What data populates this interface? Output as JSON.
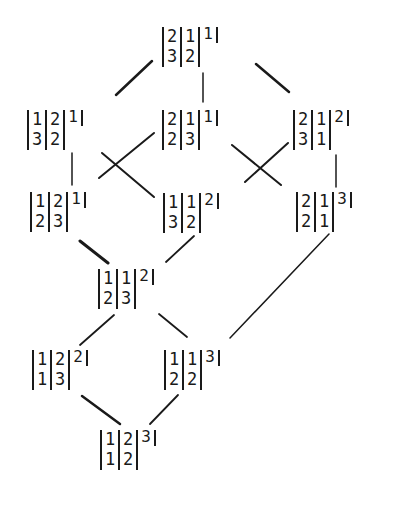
{
  "diagram": {
    "type": "lattice",
    "nodes": [
      {
        "id": "A",
        "cols": [
          [
            "2",
            "3"
          ],
          [
            "1",
            "2"
          ]
        ],
        "single": "1"
      },
      {
        "id": "B1",
        "cols": [
          [
            "1",
            "3"
          ],
          [
            "2",
            "2"
          ]
        ],
        "single": "1"
      },
      {
        "id": "B2",
        "cols": [
          [
            "2",
            "2"
          ],
          [
            "1",
            "3"
          ]
        ],
        "single": "1"
      },
      {
        "id": "B3",
        "cols": [
          [
            "2",
            "3"
          ],
          [
            "1",
            "1"
          ]
        ],
        "single": "2"
      },
      {
        "id": "C1",
        "cols": [
          [
            "1",
            "2"
          ],
          [
            "2",
            "3"
          ]
        ],
        "single": "1"
      },
      {
        "id": "C2",
        "cols": [
          [
            "1",
            "3"
          ],
          [
            "1",
            "2"
          ]
        ],
        "single": "2"
      },
      {
        "id": "C3",
        "cols": [
          [
            "2",
            "2"
          ],
          [
            "1",
            "1"
          ]
        ],
        "single": "3"
      },
      {
        "id": "D",
        "cols": [
          [
            "1",
            "2"
          ],
          [
            "1",
            "3"
          ]
        ],
        "single": "2"
      },
      {
        "id": "E1",
        "cols": [
          [
            "1",
            "1"
          ],
          [
            "2",
            "3"
          ]
        ],
        "single": "2"
      },
      {
        "id": "E2",
        "cols": [
          [
            "1",
            "2"
          ],
          [
            "1",
            "2"
          ]
        ],
        "single": "3"
      },
      {
        "id": "F",
        "cols": [
          [
            "1",
            "1"
          ],
          [
            "2",
            "2"
          ]
        ],
        "single": "3"
      }
    ],
    "edges": [
      [
        "A",
        "B1"
      ],
      [
        "A",
        "B2"
      ],
      [
        "A",
        "B3"
      ],
      [
        "B1",
        "C1"
      ],
      [
        "B1",
        "C2"
      ],
      [
        "B2",
        "C1"
      ],
      [
        "B2",
        "C3"
      ],
      [
        "B3",
        "C2"
      ],
      [
        "B3",
        "C3"
      ],
      [
        "C1",
        "D"
      ],
      [
        "C2",
        "D"
      ],
      [
        "C3",
        "E2"
      ],
      [
        "D",
        "E1"
      ],
      [
        "D",
        "E2"
      ],
      [
        "E1",
        "F"
      ],
      [
        "E2",
        "F"
      ]
    ]
  }
}
